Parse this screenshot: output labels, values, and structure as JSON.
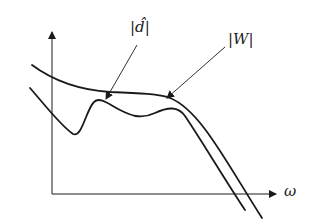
{
  "diagram": {
    "type": "frequency-response-sketch",
    "axes": {
      "x_label": "ω",
      "y_label": ""
    },
    "curves": [
      {
        "id": "W",
        "label": "|W|",
        "description": "upper bound weight magnitude"
      },
      {
        "id": "d_hat",
        "label": "|d̂|",
        "description": "disturbance estimate magnitude"
      }
    ],
    "annotations": [
      {
        "text": "|d̂|",
        "points_to": "d_hat"
      },
      {
        "text": "|W|",
        "points_to": "W"
      }
    ],
    "colors": {
      "ink": "#1a1a1a",
      "background": "#ffffff"
    }
  }
}
